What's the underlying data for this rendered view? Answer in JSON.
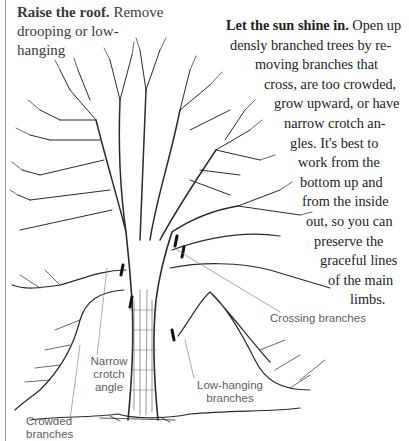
{
  "captions": {
    "raise_roof": {
      "heading": "Raise the roof.",
      "lines": [
        "Remove",
        "drooping or low-",
        "hanging"
      ]
    },
    "sun_shine": {
      "heading": "Let the sun shine in.",
      "lines": [
        "Let the sun shine in. Open up",
        "densly branched trees by re-",
        "moving branches that",
        "cross, are too crowded,",
        "grow upward, or have",
        "narrow crotch an-",
        "gles. It's best to",
        "work from the",
        "bottom up and",
        "from the inside",
        "out, so you can",
        "preserve the",
        "graceful lines",
        "of the main",
        "limbs."
      ]
    }
  },
  "labels": {
    "crossing": "Crossing branches",
    "narrow_crotch": [
      "Narrow",
      "crotch",
      "angle"
    ],
    "low_hanging": [
      "Low-hanging",
      "branches"
    ],
    "crowded": [
      "Crowded",
      "branches"
    ]
  },
  "colors": {
    "ink": "#222222",
    "label": "#5e5e5e",
    "rule": "#9a9a9a"
  }
}
